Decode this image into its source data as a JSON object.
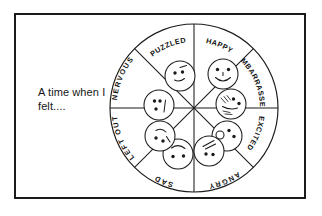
{
  "worksheet": {
    "prompt": "A time when I\nfelt....",
    "frame_color": "#1b1b1b",
    "ink_color": "#1b1b1b",
    "background_color": "#ffffff"
  },
  "wheel": {
    "name": "feelings-wheel",
    "segment_count": 8,
    "segments": [
      {
        "label": "HAPPY",
        "expression": "smiling-face",
        "mouth": "smile",
        "position": "top-right"
      },
      {
        "label": "EMBARRASSED",
        "expression": "blushing-face",
        "mouth": "wavy-blush",
        "position": "right-upper"
      },
      {
        "label": "EXCITED",
        "expression": "open-mouth-face",
        "mouth": "open-o",
        "position": "right-lower"
      },
      {
        "label": "ANGRY",
        "expression": "angry-face",
        "mouth": "frown-slant",
        "position": "bottom-right"
      },
      {
        "label": "SAD",
        "expression": "sad-face",
        "mouth": "frown",
        "position": "bottom-left"
      },
      {
        "label": "LEFT OUT",
        "expression": "downcast-face",
        "mouth": "small-frown",
        "position": "left-lower"
      },
      {
        "label": "NERVOUS",
        "expression": "nervous-face",
        "mouth": "straight-line",
        "position": "left-upper"
      },
      {
        "label": "PUZZLED",
        "expression": "puzzled-face",
        "mouth": "crooked-line",
        "position": "top-left"
      }
    ]
  }
}
